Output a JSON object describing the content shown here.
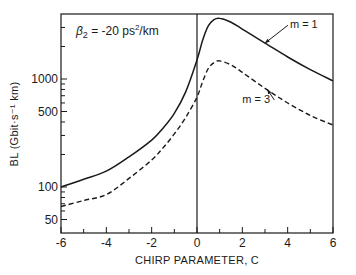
{
  "chart_data": {
    "type": "line",
    "title_parts": {
      "symbol": "β",
      "subscript": "2",
      "value": " = -20 ps",
      "sup": "2",
      "unit": "/km"
    },
    "xlabel": "CHIRP PARAMETER, C",
    "ylabel": "BL (Gbit·s⁻¹ km)",
    "xlim": [
      -6,
      6
    ],
    "ylim": [
      37,
      4000
    ],
    "yscale": "log",
    "grid": false,
    "x_ticks": [
      -6,
      -4,
      -2,
      0,
      2,
      4,
      6
    ],
    "x_minor_ticks": [
      -5,
      -3,
      -1,
      1,
      3,
      5
    ],
    "y_ticks": [
      50,
      100,
      500,
      1000
    ],
    "y_tick_labels": [
      "50",
      "100",
      "500",
      "1000"
    ],
    "y_minor_ticks": [
      60,
      70,
      80,
      90,
      200,
      300,
      400,
      600,
      700,
      800,
      900,
      2000,
      3000
    ],
    "vertical_line_at": 0,
    "x": [
      -6,
      -5,
      -4,
      -3,
      -2,
      -1.5,
      -1,
      -0.5,
      0,
      0.25,
      0.5,
      0.75,
      1,
      1.5,
      2,
      3,
      4,
      5,
      6
    ],
    "series": [
      {
        "name": "m = 1",
        "style": "solid",
        "values": [
          100,
          118,
          140,
          190,
          272,
          350,
          480,
          760,
          1500,
          2300,
          3100,
          3550,
          3650,
          3350,
          2900,
          2150,
          1600,
          1220,
          960
        ]
      },
      {
        "name": "m = 3",
        "style": "dashed",
        "values": [
          66,
          75,
          85,
          120,
          178,
          230,
          310,
          440,
          680,
          950,
          1250,
          1420,
          1470,
          1350,
          1150,
          820,
          600,
          460,
          375
        ]
      }
    ],
    "annotations": [
      {
        "text": "m = 1",
        "target_series": "m = 1",
        "label_x": 4.1,
        "label_y": 2950,
        "arrow_to_x": 3.0,
        "arrow_to_y": 2150
      },
      {
        "text": "m = 3",
        "target_series": "m = 3",
        "label_x": 2.0,
        "label_y": 600,
        "arrow_to_x": 3.1,
        "arrow_to_y": 800
      }
    ],
    "legend": null
  }
}
